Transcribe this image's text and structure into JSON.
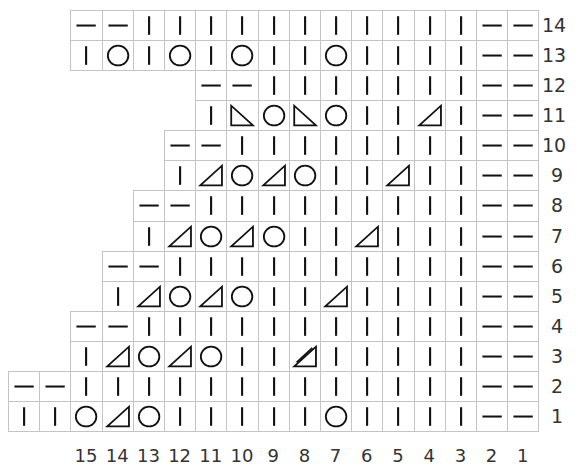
{
  "chart_info": {
    "grid_columns": 17,
    "rows_bottom_to_top": 14,
    "cell_width": 31.2,
    "cell_height": 30.07,
    "grid_left": 8,
    "grid_bottom": 431,
    "line_color": "#c4c4c4",
    "symbol_color": "#111111"
  },
  "legend_codes": {
    "k": "knit (vertical bar)",
    "p": "purl (horizontal bar)",
    "yo": "yarn over (circle)",
    "k2tog": "k2tog (right-leaning triangle)",
    "ssk": "ssk (left-leaning triangle)",
    "k3tog": "k3tog (double-line triangle)"
  },
  "rows": [
    {
      "number": "1",
      "cells": [
        "k",
        "k",
        "yo",
        "k2tog",
        "yo",
        "k",
        "k",
        "k",
        "k",
        "k",
        "yo",
        "k",
        "k",
        "k",
        "k",
        "p",
        "p"
      ]
    },
    {
      "number": "2",
      "cells": [
        "p",
        "p",
        "k",
        "k",
        "k",
        "k",
        "k",
        "k",
        "k",
        "k",
        "k",
        "k",
        "k",
        "k",
        "k",
        "p",
        "p"
      ]
    },
    {
      "number": "3",
      "cells": [
        "k",
        "k2tog",
        "yo",
        "k2tog",
        "yo",
        "k",
        "k",
        "k3tog",
        "k",
        "k",
        "k",
        "k",
        "k",
        "p",
        "p"
      ]
    },
    {
      "number": "4",
      "cells": [
        "p",
        "p",
        "k",
        "k",
        "k",
        "k",
        "k",
        "k",
        "k",
        "k",
        "k",
        "k",
        "k",
        "p",
        "p"
      ]
    },
    {
      "number": "5",
      "cells": [
        "k",
        "k2tog",
        "yo",
        "k2tog",
        "yo",
        "k",
        "k",
        "k2tog",
        "k",
        "k",
        "k",
        "k",
        "p",
        "p"
      ]
    },
    {
      "number": "6",
      "cells": [
        "p",
        "p",
        "k",
        "k",
        "k",
        "k",
        "k",
        "k",
        "k",
        "k",
        "k",
        "k",
        "p",
        "p"
      ]
    },
    {
      "number": "7",
      "cells": [
        "k",
        "k2tog",
        "yo",
        "k2tog",
        "yo",
        "k",
        "k",
        "k2tog",
        "k",
        "k",
        "k",
        "p",
        "p"
      ]
    },
    {
      "number": "8",
      "cells": [
        "p",
        "p",
        "k",
        "k",
        "k",
        "k",
        "k",
        "k",
        "k",
        "k",
        "k",
        "p",
        "p"
      ]
    },
    {
      "number": "9",
      "cells": [
        "k",
        "k2tog",
        "yo",
        "k2tog",
        "yo",
        "k",
        "k",
        "k2tog",
        "k",
        "k",
        "p",
        "p"
      ]
    },
    {
      "number": "10",
      "cells": [
        "p",
        "p",
        "k",
        "k",
        "k",
        "k",
        "k",
        "k",
        "k",
        "k",
        "p",
        "p"
      ]
    },
    {
      "number": "11",
      "cells": [
        "k",
        "ssk",
        "yo",
        "ssk",
        "yo",
        "k",
        "k",
        "k2tog",
        "k",
        "p",
        "p"
      ]
    },
    {
      "number": "12",
      "cells": [
        "p",
        "p",
        "k",
        "k",
        "k",
        "k",
        "k",
        "k",
        "k",
        "p",
        "p"
      ]
    },
    {
      "number": "13",
      "cells": [
        "k",
        "yo",
        "k",
        "yo",
        "k",
        "yo",
        "k",
        "k",
        "yo",
        "k",
        "k",
        "k",
        "k",
        "p",
        "p"
      ]
    },
    {
      "number": "14",
      "cells": [
        "p",
        "p",
        "k",
        "k",
        "k",
        "k",
        "k",
        "k",
        "k",
        "k",
        "k",
        "k",
        "k",
        "p",
        "p"
      ]
    }
  ],
  "column_numbers": [
    "15",
    "14",
    "13",
    "12",
    "11",
    "10",
    "9",
    "8",
    "7",
    "6",
    "5",
    "4",
    "3",
    "2",
    "1"
  ]
}
